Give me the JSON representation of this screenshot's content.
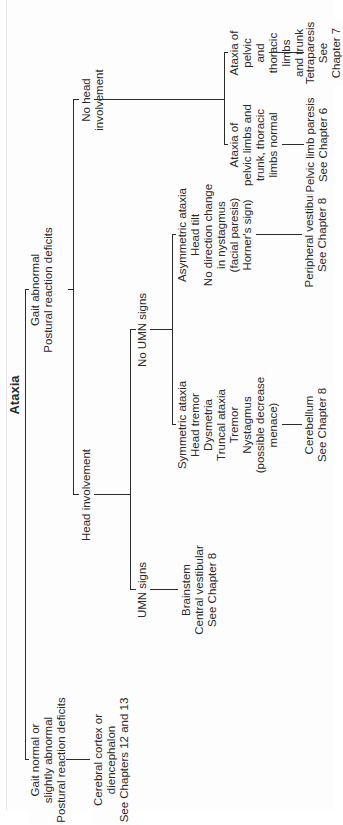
{
  "diagram": {
    "title": "Ataxia",
    "level1": {
      "left": "Gait normal or\nslightly abnormal\nPostural reaction deficits",
      "right": "Gait abnormal\nPostural reaction deficits"
    },
    "cortex": "Cerebral cortex or\ndiencephalon\nSee Chapters 12 and 13",
    "level2": {
      "head": "Head involvement",
      "no_head": "No head involvement"
    },
    "head_branches": {
      "umn": "UMN signs",
      "no_umn": "No UMN signs"
    },
    "brainstem": "Brainstem\nCentral vestibular\nSee Chapter 8",
    "symmetric": "Symmetric ataxia\nHead tremor\nDysmetria\nTruncal ataxia\nTremor\nNystagmus\n(possible decrease\nmenace)",
    "asymmetric": "Asymmetric ataxia\nHead tilt\nNo direction change\nin nystagmus\n(facial paresis)\nHorner's sign)",
    "cerebellum": "Cerebellum\nSee Chapter 8",
    "peripheral": "Peripheral vestibular\nSee Chapter 8",
    "pelvic_ataxia": "Ataxia of\npelvic limbs and\ntrunk, thoracic\nlimbs normal",
    "all_limbs_ataxia": "Ataxia of pelvic\nand thoracic limbs\nand trunk",
    "pelvic_paresis": "Pelvic limb paresis\nSee Chapter 6",
    "tetraparesis": "Tetraparesis\nSee Chapter 7"
  }
}
